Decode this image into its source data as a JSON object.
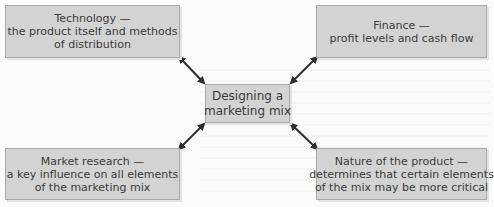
{
  "diagram": {
    "center": {
      "lines": [
        "Designing a",
        "marketing mix"
      ]
    },
    "nodes": {
      "top_left": {
        "lines": [
          "Technology —",
          "the product itself and methods",
          "of distribution"
        ]
      },
      "top_right": {
        "lines": [
          "Finance —",
          "profit levels and cash flow"
        ]
      },
      "bottom_left": {
        "lines": [
          "Market research —",
          "a key influence on all elements",
          "of the marketing mix"
        ]
      },
      "bottom_right": {
        "lines": [
          "Nature of the product —",
          "determines that certain elements",
          "of the mix may be more critical"
        ]
      }
    },
    "connectors": [
      {
        "from": "top_left",
        "to": "center",
        "type": "double-arrow"
      },
      {
        "from": "top_right",
        "to": "center",
        "type": "double-arrow"
      },
      {
        "from": "bottom_left",
        "to": "center",
        "type": "double-arrow"
      },
      {
        "from": "bottom_right",
        "to": "center",
        "type": "double-arrow"
      }
    ],
    "colors": {
      "box_fill": "#d3d3d3",
      "box_border": "#a9a9a9",
      "text": "#3a3a3a",
      "arrow": "#2e2e2e"
    }
  }
}
